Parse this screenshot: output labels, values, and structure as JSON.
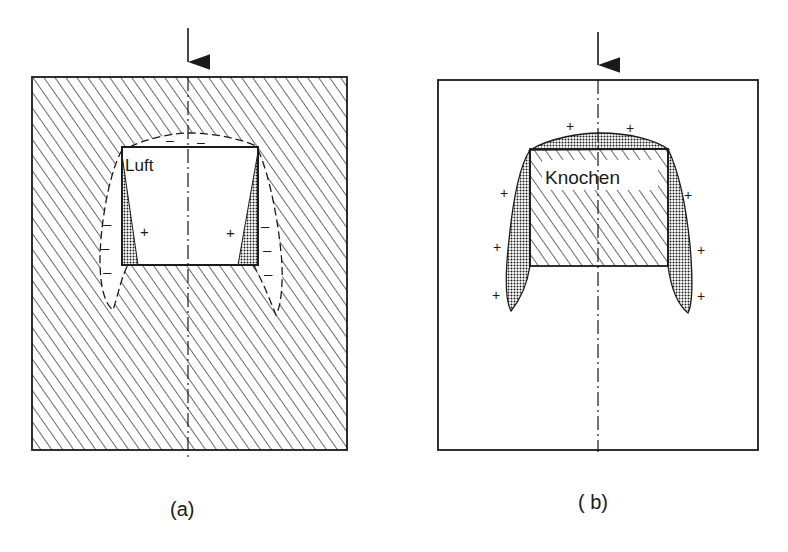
{
  "panels": [
    {
      "id": "a",
      "caption": "(a)",
      "inclusion_label": "Luft",
      "outer_material": "hatched",
      "inclusion_material": "empty",
      "signs": {
        "top": [
          "–",
          "–"
        ],
        "inner_left": "+",
        "inner_right": "+",
        "outer_left": [
          "–",
          "–",
          "–"
        ],
        "outer_right": [
          "–",
          "–",
          "–"
        ]
      }
    },
    {
      "id": "b",
      "caption": "( b)",
      "inclusion_label": "Knochen",
      "outer_material": "empty",
      "inclusion_material": "hatched",
      "signs": {
        "top": [
          "+",
          "+"
        ],
        "left": [
          "+",
          "+",
          "+"
        ],
        "right": [
          "+",
          "+",
          "+"
        ]
      }
    }
  ],
  "colors": {
    "ink": "#1a1a1a",
    "background": "#ffffff"
  }
}
